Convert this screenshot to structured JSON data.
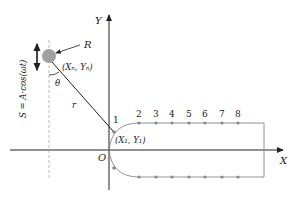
{
  "diagram": {
    "axes": {
      "x_label": "X",
      "y_label": "Y",
      "origin_label": "O"
    },
    "pendulum": {
      "mass_label": "R",
      "pivot_label": "(Xₙ, Yₙ)",
      "angle_label": "θ",
      "arm_label": "r",
      "motion_label": "S = A·cos(ωt)"
    },
    "track": {
      "start_label": "1",
      "start_coord_label": "(X₁, Y₁)",
      "point_labels": [
        "2",
        "3",
        "4",
        "5",
        "6",
        "7",
        "8"
      ]
    },
    "colors": {
      "line": "#222222",
      "track": "#888888",
      "mass": "#a0a0a0"
    }
  }
}
